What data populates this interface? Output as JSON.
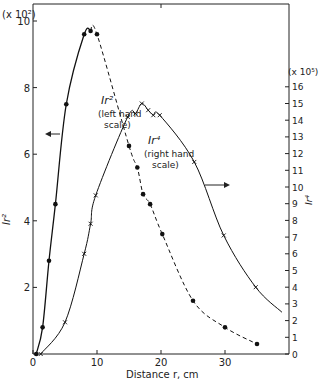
{
  "chart_data": {
    "type": "line",
    "title": "",
    "xlabel": "Distance r,  cm",
    "ylabel_left": "Ir²",
    "ylabel_right": "Ir⁴",
    "left_multiplier": "(x 10²)",
    "right_multiplier": "(x 10⁵)",
    "xlim": [
      0,
      40
    ],
    "ylim_left": [
      0,
      10.4
    ],
    "ylim_right": [
      0,
      16.5
    ],
    "x_ticks": [
      0,
      10,
      20,
      30
    ],
    "y_ticks_left": [
      2,
      4,
      6,
      8,
      10
    ],
    "y_ticks_right": [
      0,
      1,
      2,
      3,
      4,
      5,
      6,
      7,
      8,
      9,
      10,
      11,
      12,
      13,
      14,
      15,
      16
    ],
    "grid": false,
    "series": [
      {
        "name": "Ir² (left hand scale)",
        "axis": "left",
        "marker": "dot",
        "x": [
          0.5,
          1.5,
          2.5,
          3.5,
          5.2,
          8.0,
          9.0,
          10.0,
          15.0,
          16.3,
          17.2,
          18.3,
          20.2,
          25.0,
          30.0,
          35.0
        ],
        "values": [
          0,
          0.8,
          2.8,
          4.5,
          7.5,
          9.6,
          9.7,
          9.6,
          6.25,
          5.6,
          4.8,
          4.5,
          3.6,
          1.6,
          0.8,
          0.3
        ]
      },
      {
        "name": "Ir⁴ (right hand scale)",
        "axis": "right",
        "marker": "x",
        "x": [
          1.2,
          5.0,
          8.0,
          9.0,
          9.8,
          14.8,
          16.0,
          17.0,
          18.0,
          18.8,
          19.8,
          25.2,
          29.8,
          34.8
        ],
        "values": [
          0,
          1.9,
          6.0,
          7.8,
          9.5,
          14.2,
          14.4,
          15.0,
          14.6,
          14.3,
          14.3,
          11.5,
          7.1,
          4.0
        ]
      }
    ],
    "annotations": [
      {
        "text": "Ir²",
        "sub": "(left hand",
        "sub2": "scale)"
      },
      {
        "text": "Ir⁴",
        "sub": "(right hand",
        "sub2": "scale)"
      }
    ]
  },
  "labels": {
    "left_mult": "(x 10²)",
    "right_mult": "(x 10⁵)",
    "ylabel_left": "Ir²",
    "ylabel_right": "Ir⁴",
    "xlabel": "Distance r,  cm",
    "ann1_a": "Ir²",
    "ann1_b": "(left hand",
    "ann1_c": "scale)",
    "ann2_a": "Ir⁴",
    "ann2_b": "(right hand",
    "ann2_c": "scale)"
  }
}
